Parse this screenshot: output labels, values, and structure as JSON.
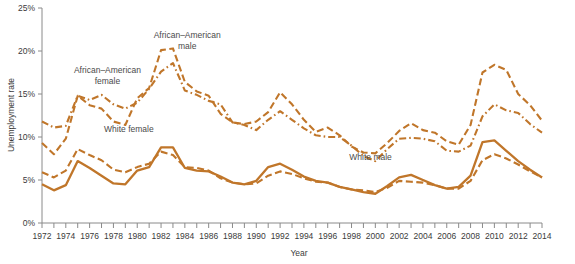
{
  "chart_data": {
    "type": "line",
    "title": "",
    "xlabel": "Year",
    "ylabel": "Unemployment rate",
    "xlim": [
      1972,
      2014
    ],
    "ylim": [
      0,
      25
    ],
    "yticks": [
      0,
      5,
      10,
      15,
      20,
      25
    ],
    "ytick_labels": [
      "0%",
      "5%",
      "10%",
      "15%",
      "20%",
      "25%"
    ],
    "xticks": [
      1972,
      1973,
      1974,
      1975,
      1976,
      1977,
      1978,
      1979,
      1980,
      1981,
      1982,
      1983,
      1984,
      1985,
      1986,
      1987,
      1988,
      1989,
      1990,
      1991,
      1992,
      1993,
      1994,
      1995,
      1996,
      1997,
      1998,
      1999,
      2000,
      2001,
      2002,
      2003,
      2004,
      2005,
      2006,
      2007,
      2008,
      2009,
      2010,
      2011,
      2012,
      2013,
      2014
    ],
    "xtick_labels": [
      "1972",
      "1974",
      "1976",
      "1978",
      "1980",
      "1982",
      "1984",
      "1986",
      "1988",
      "1990",
      "1992",
      "1994",
      "1996",
      "1998",
      "2000",
      "2002",
      "2004",
      "2006",
      "2008",
      "2010",
      "2012",
      "2014"
    ],
    "xtick_label_years": [
      1972,
      1974,
      1976,
      1978,
      1980,
      1982,
      1984,
      1986,
      1988,
      1990,
      1992,
      1994,
      1996,
      1998,
      2000,
      2002,
      2004,
      2006,
      2008,
      2010,
      2012,
      2014
    ],
    "grid": false,
    "legend_position": "inline-annotations",
    "line_color": "#c0762a",
    "x": [
      1972,
      1973,
      1974,
      1975,
      1976,
      1977,
      1978,
      1979,
      1980,
      1981,
      1982,
      1983,
      1984,
      1985,
      1986,
      1987,
      1988,
      1989,
      1990,
      1991,
      1992,
      1993,
      1994,
      1995,
      1996,
      1997,
      1998,
      1999,
      2000,
      2001,
      2002,
      2003,
      2004,
      2005,
      2006,
      2007,
      2008,
      2009,
      2010,
      2011,
      2012,
      2013,
      2014
    ],
    "series": [
      {
        "name": "African–American male",
        "style": "dashed",
        "label_x": 1984.2,
        "label_y": 21.5,
        "values": [
          9.3,
          8.0,
          9.8,
          14.8,
          13.7,
          13.3,
          11.8,
          11.4,
          14.5,
          15.7,
          20.1,
          20.3,
          16.4,
          15.3,
          14.8,
          12.7,
          11.7,
          11.5,
          11.8,
          12.9,
          15.2,
          13.8,
          12.0,
          10.6,
          11.1,
          10.2,
          8.9,
          8.2,
          8.1,
          9.3,
          10.7,
          11.6,
          10.8,
          10.5,
          9.5,
          9.1,
          11.4,
          17.5,
          18.4,
          17.8,
          15.0,
          13.7,
          11.9
        ]
      },
      {
        "name": "African–American female",
        "style": "dash-dot",
        "label_x": 1977.5,
        "label_y": 17.4,
        "values": [
          11.8,
          11.1,
          11.3,
          14.8,
          14.3,
          14.9,
          13.8,
          13.3,
          14.0,
          15.6,
          17.6,
          18.6,
          15.4,
          14.9,
          14.2,
          13.8,
          11.7,
          11.4,
          10.8,
          12.0,
          13.0,
          12.0,
          11.0,
          10.2,
          10.0,
          10.0,
          9.0,
          7.8,
          7.2,
          8.6,
          9.8,
          9.9,
          9.8,
          9.5,
          8.4,
          8.3,
          9.0,
          12.4,
          13.8,
          13.1,
          12.8,
          11.5,
          10.5
        ]
      },
      {
        "name": "White male",
        "style": "solid",
        "label_x": 1999.6,
        "label_y": 7.3,
        "values": [
          4.5,
          3.8,
          4.4,
          7.2,
          6.4,
          5.5,
          4.6,
          4.5,
          6.1,
          6.5,
          8.8,
          8.8,
          6.4,
          6.1,
          6.0,
          5.4,
          4.7,
          4.5,
          4.9,
          6.5,
          6.9,
          6.2,
          5.4,
          4.9,
          4.7,
          4.2,
          3.9,
          3.6,
          3.4,
          4.3,
          5.3,
          5.6,
          5.0,
          4.4,
          4.0,
          4.2,
          5.5,
          9.4,
          9.6,
          8.4,
          7.2,
          6.2,
          5.3
        ]
      },
      {
        "name": "White female",
        "style": "dashed",
        "label_x": 1979.3,
        "label_y": 10.6,
        "values": [
          5.9,
          5.3,
          6.1,
          8.6,
          7.9,
          7.3,
          6.2,
          5.9,
          6.5,
          6.9,
          8.3,
          7.9,
          6.5,
          6.4,
          6.1,
          5.2,
          4.7,
          4.5,
          4.6,
          5.5,
          6.0,
          5.7,
          5.2,
          4.8,
          4.7,
          4.2,
          3.9,
          3.8,
          3.6,
          4.1,
          4.9,
          4.8,
          4.7,
          4.4,
          4.0,
          4.0,
          4.9,
          7.3,
          8.0,
          7.5,
          6.8,
          6.0,
          5.3
        ]
      }
    ]
  }
}
